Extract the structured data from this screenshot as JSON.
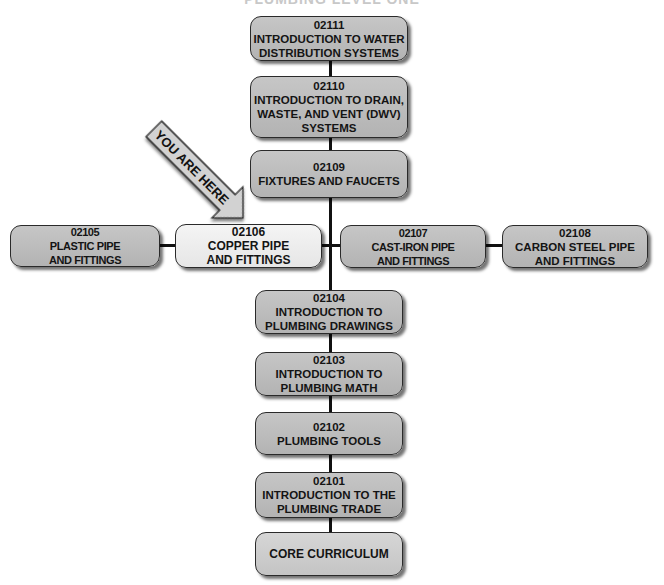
{
  "title": "PLUMBING LEVEL ONE",
  "colors": {
    "box_fill": "#bdbdbd",
    "current_fill": "#eeeeee",
    "core_fill": "#cfcfcf",
    "connector": "#111111",
    "arrow_fill": "#d2d2d2"
  },
  "indicator": {
    "label": "YOU ARE HERE",
    "points_to": "02106"
  },
  "modules": {
    "m02111": {
      "code": "02111",
      "label": "INTRODUCTION TO WATER\nDISTRIBUTION SYSTEMS"
    },
    "m02110": {
      "code": "02110",
      "label": "INTRODUCTION TO DRAIN,\nWASTE, AND VENT (DWV)\nSYSTEMS"
    },
    "m02109": {
      "code": "02109",
      "label": "FIXTURES AND FAUCETS"
    },
    "m02105": {
      "code": "02105",
      "label": "PLASTIC PIPE\nAND FITTINGS"
    },
    "m02106": {
      "code": "02106",
      "label": "COPPER PIPE\nAND FITTINGS"
    },
    "m02107": {
      "code": "02107",
      "label": "CAST-IRON PIPE\nAND FITTINGS"
    },
    "m02108": {
      "code": "02108",
      "label": "CARBON STEEL PIPE\nAND FITTINGS"
    },
    "m02104": {
      "code": "02104",
      "label": "INTRODUCTION TO\nPLUMBING DRAWINGS"
    },
    "m02103": {
      "code": "02103",
      "label": "INTRODUCTION TO\nPLUMBING MATH"
    },
    "m02102": {
      "code": "02102",
      "label": "PLUMBING TOOLS"
    },
    "m02101": {
      "code": "02101",
      "label": "INTRODUCTION TO THE\nPLUMBING TRADE"
    },
    "core": {
      "label": "CORE CURRICULUM"
    }
  }
}
